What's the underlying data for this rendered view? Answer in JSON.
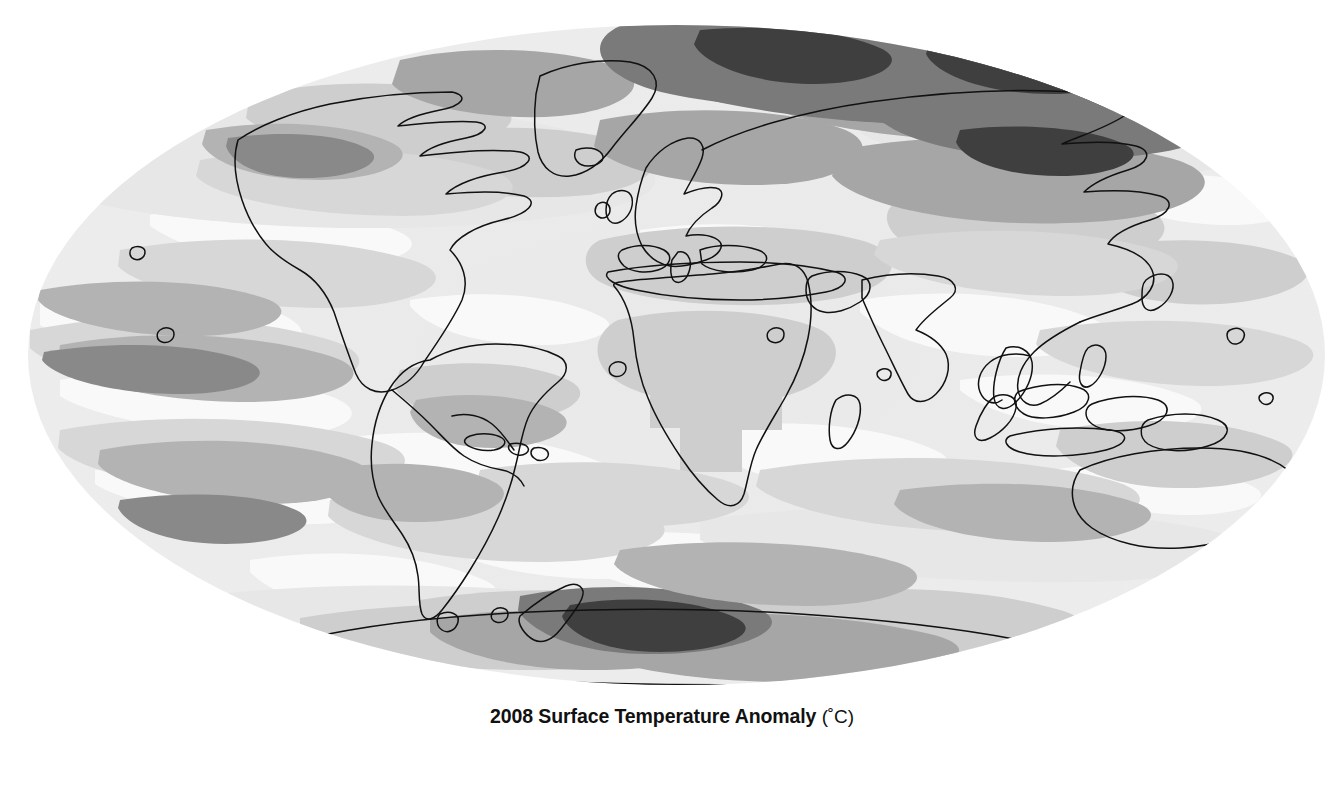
{
  "figure": {
    "type": "map",
    "projection": "mollweide",
    "title": "2008 Surface Temperature Anomaly",
    "units": "(˚C)",
    "background": "#ffffff",
    "map_bbox": {
      "left": 28,
      "top": 25,
      "right": 1325,
      "bottom": 685
    }
  },
  "legend": {
    "title_main": "2008 Surface Temperature Anomaly",
    "title_units": "(˚C)",
    "orientation": "horizontal",
    "gap_at_center": true,
    "swatches": [
      {
        "label": "-3.5 to -2.5",
        "color": "#262626",
        "low": -3.5,
        "high": -2.5
      },
      {
        "label": "-2.5 to -1.5",
        "color": "#555555",
        "low": -2.5,
        "high": -1.5
      },
      {
        "label": "-1.5 to -1",
        "color": "#8a8a8a",
        "low": -1.5,
        "high": -1.0
      },
      {
        "label": "-1 to -0.6",
        "color": "#b6b6b6",
        "low": -1.0,
        "high": -0.6
      },
      {
        "label": "-0.6 to -0.2",
        "color": "#dcdcdc",
        "low": -0.6,
        "high": -0.2
      },
      {
        "label": "-0.2 to 0.2",
        "color": "#ffffff",
        "low": -0.2,
        "high": 0.2
      },
      {
        "label": "0.2 to 0.6",
        "color": "#ededed",
        "low": 0.2,
        "high": 0.6
      },
      {
        "label": "0.6 to 1",
        "color": "#d2d2d2",
        "low": 0.6,
        "high": 1.0
      },
      {
        "label": "1 to 1.5",
        "color": "#a8a8a8",
        "low": 1.0,
        "high": 1.5
      },
      {
        "label": "1.5 to 2.5",
        "color": "#7a7a7a",
        "low": 1.5,
        "high": 2.5
      },
      {
        "label": "2.5 to 3.5",
        "color": "#3c3c3c",
        "low": 2.5,
        "high": 3.5
      }
    ],
    "ticks": [
      "-3.5",
      "-2.5",
      "-1.5",
      "-1",
      "-0.6",
      "-0.2",
      "0.2",
      "0.6",
      "1",
      "1.5",
      "2.5",
      "3.5"
    ]
  },
  "chart_data": {
    "type": "heatmap",
    "title": "2008 Surface Temperature Anomaly (˚C)",
    "subtitle": "",
    "xlabel": "",
    "ylabel": "",
    "projection": "Mollweide",
    "colorbar_label": "˚C",
    "colorbar_ticks": [
      -3.5,
      -2.5,
      -1.5,
      -1,
      -0.6,
      -0.2,
      0.2,
      0.6,
      1,
      1.5,
      2.5,
      3.5
    ],
    "colorbar_colors": [
      "#262626",
      "#555555",
      "#8a8a8a",
      "#b6b6b6",
      "#dcdcdc",
      "#ffffff",
      "#ededed",
      "#d2d2d2",
      "#a8a8a8",
      "#7a7a7a",
      "#3c3c3c"
    ],
    "value_range": [
      -3.5,
      3.5
    ],
    "grid": false,
    "legend_position": "bottom",
    "regional_anomalies": [
      {
        "region": "Arctic Ocean / Northern Siberia",
        "value": 2.0,
        "band": "1.5 to 2.5"
      },
      {
        "region": "Northern Eurasia / Russia",
        "value": 1.2,
        "band": "1 to 1.5"
      },
      {
        "region": "Scandinavia / Northern Europe",
        "value": 1.2,
        "band": "1 to 1.5"
      },
      {
        "region": "Greenland / Baffin Bay",
        "value": 1.2,
        "band": "1 to 1.5"
      },
      {
        "region": "Northern Canada",
        "value": 0.8,
        "band": "0.6 to 1"
      },
      {
        "region": "Alaska",
        "value": -0.8,
        "band": "-1 to -0.6"
      },
      {
        "region": "Contiguous United States",
        "value": 0.4,
        "band": "0.2 to 0.6"
      },
      {
        "region": "Mediterranean / North Africa",
        "value": 0.8,
        "band": "0.6 to 1"
      },
      {
        "region": "Sub-Saharan Africa",
        "value": 0.8,
        "band": "0.6 to 1"
      },
      {
        "region": "Southern Africa",
        "value": 0.8,
        "band": "0.6 to 1"
      },
      {
        "region": "Middle East / Central Asia",
        "value": 0.8,
        "band": "0.6 to 1"
      },
      {
        "region": "India / South Asia",
        "value": 0.4,
        "band": "0.2 to 0.6"
      },
      {
        "region": "Eastern China",
        "value": 0.4,
        "band": "0.2 to 0.6"
      },
      {
        "region": "Southeast Asia / Indonesia",
        "value": 0.1,
        "band": "-0.2 to 0.2"
      },
      {
        "region": "Australia",
        "value": 0.4,
        "band": "0.2 to 0.6"
      },
      {
        "region": "Amazon Basin / Brazil",
        "value": 0.4,
        "band": "0.2 to 0.6"
      },
      {
        "region": "Andes / Western South America",
        "value": -0.6,
        "band": "-1 to -0.6"
      },
      {
        "region": "Southern Ocean",
        "value": -0.4,
        "band": "-0.6 to -0.2"
      },
      {
        "region": "Eastern Tropical Pacific (La Nina)",
        "value": -0.8,
        "band": "-1 to -0.6"
      },
      {
        "region": "Antarctic Peninsula / Weddell Sea",
        "value": 3.0,
        "band": "2.5 to 3.5"
      },
      {
        "region": "East Antarctica",
        "value": 1.2,
        "band": "1 to 1.5"
      },
      {
        "region": "North Atlantic",
        "value": 0.4,
        "band": "0.2 to 0.6"
      },
      {
        "region": "North Pacific",
        "value": -0.4,
        "band": "-0.6 to -0.2"
      }
    ]
  }
}
